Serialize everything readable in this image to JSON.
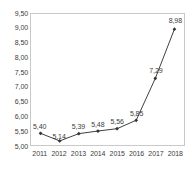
{
  "chart_data": {
    "type": "line",
    "title": "",
    "subtitle": "",
    "xlabel": "",
    "ylabel": "",
    "categories": [
      "2011",
      "2012",
      "2013",
      "2014",
      "2015",
      "2016",
      "2017",
      "2018"
    ],
    "values": [
      5.4,
      5.14,
      5.39,
      5.48,
      5.56,
      5.85,
      7.29,
      8.98
    ],
    "data_labels": [
      "5,40",
      "5,14",
      "5,39",
      "5,48",
      "5,56",
      "5,85",
      "7,29",
      "8,98"
    ],
    "ylim": [
      5.0,
      9.5
    ],
    "ytick_values": [
      5.0,
      5.5,
      6.0,
      6.5,
      7.0,
      7.5,
      8.0,
      8.5,
      9.0,
      9.5
    ],
    "ytick_labels": [
      "5,00",
      "5,50",
      "6,00",
      "6,50",
      "7,00",
      "7,50",
      "8,00",
      "8,50",
      "9,00",
      "9,50"
    ],
    "xtick_labels": [
      "2011",
      "2012",
      "2013",
      "2014",
      "2015",
      "2016",
      "2017",
      "2018"
    ],
    "grid": false,
    "legend": null,
    "legend_position": "none",
    "annotations": [],
    "decimal_separator": ",",
    "series": [
      {
        "name": "",
        "values": [
          5.4,
          5.14,
          5.39,
          5.48,
          5.56,
          5.85,
          7.29,
          8.98
        ]
      }
    ],
    "colors": {
      "line": "#404040",
      "marker": "#333333",
      "plot_border": "#c9c9c9",
      "text": "#3c3c3c",
      "background": "#ffffff"
    }
  }
}
